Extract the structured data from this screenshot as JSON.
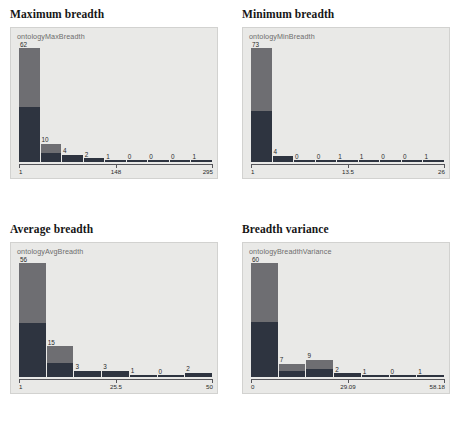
{
  "chart_data": [
    {
      "type": "bar",
      "title": "Maximum breadth",
      "series_label": "ontologyMaxBreadth",
      "xlabel": "",
      "ylabel": "",
      "grid": false,
      "legend": "none",
      "axis_ticks": [
        "1",
        "148",
        "295"
      ],
      "xlim": [
        1,
        295
      ],
      "ylim": [
        0,
        62
      ],
      "bin_count": 9,
      "values": [
        62,
        10,
        4,
        2,
        1,
        0,
        0,
        0,
        1
      ],
      "split_fraction": 0.52
    },
    {
      "type": "bar",
      "title": "Minimum breadth",
      "series_label": "ontologyMinBreadth",
      "xlabel": "",
      "ylabel": "",
      "grid": false,
      "legend": "none",
      "axis_ticks": [
        "1",
        "13.5",
        "26"
      ],
      "xlim": [
        1,
        26
      ],
      "ylim": [
        0,
        73
      ],
      "bin_count": 9,
      "values": [
        73,
        4,
        0,
        0,
        1,
        1,
        0,
        0,
        1
      ],
      "split_fraction": 0.55
    },
    {
      "type": "bar",
      "title": "Average breadth",
      "series_label": "ontologyAvgBreadth",
      "xlabel": "",
      "ylabel": "",
      "grid": false,
      "legend": "none",
      "axis_ticks": [
        "1",
        "25.5",
        "50"
      ],
      "xlim": [
        1,
        50
      ],
      "ylim": [
        0,
        56
      ],
      "bin_count": 7,
      "values": [
        56,
        15,
        3,
        3,
        1,
        0,
        2
      ],
      "split_fraction": 0.53
    },
    {
      "type": "bar",
      "title": "Breadth variance",
      "series_label": "ontologyBreadthVariance",
      "xlabel": "",
      "ylabel": "",
      "grid": false,
      "legend": "none",
      "axis_ticks": [
        "0",
        "29.09",
        "58.18"
      ],
      "xlim": [
        0,
        58.18
      ],
      "ylim": [
        0,
        60
      ],
      "bin_count": 7,
      "values": [
        60,
        7,
        9,
        2,
        1,
        0,
        1
      ],
      "split_fraction": 0.52
    }
  ],
  "colors": {
    "plot_background": "#e9e9e7",
    "bar_dark": "#2e3440",
    "bar_light": "#6e6e72",
    "axis": "#55555a",
    "title_text": "#161616",
    "series_label_text": "#6d6d6d"
  }
}
